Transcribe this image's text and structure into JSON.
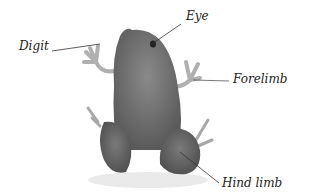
{
  "figure": {
    "labels": {
      "digit": "Digit",
      "eye": "Eye",
      "forelimb": "Forelimb",
      "hind_limb": "Hind limb"
    }
  }
}
